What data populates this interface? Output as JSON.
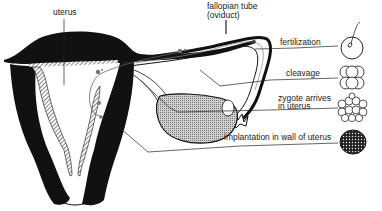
{
  "diagram": {
    "labels": {
      "uterus": "uterus",
      "fallopian_tube_line1": "fallopian tube",
      "fallopian_tube_line2": "(oviduct)",
      "fertilization": "fertilization",
      "cleavage": "cleavage",
      "zygote_line1": "zygote arrives",
      "zygote_line2": "in uterus",
      "implantation": "implantation in wall of uterus"
    },
    "stages": [
      {
        "name": "fertilization",
        "icon": "egg-with-sperm-icon"
      },
      {
        "name": "cleavage",
        "icon": "cleaving-cells-icon"
      },
      {
        "name": "zygote arrives in uterus",
        "icon": "morula-icon"
      },
      {
        "name": "implantation in wall of uterus",
        "icon": "blastocyst-icon"
      }
    ],
    "colors": {
      "ink": "#111111",
      "ovary_fill": "#b5b5b5",
      "background": "#ffffff"
    }
  }
}
